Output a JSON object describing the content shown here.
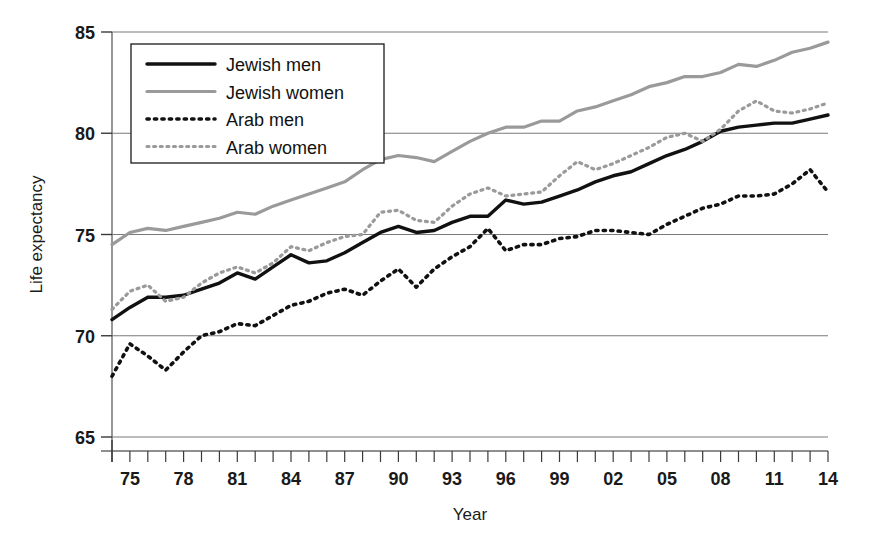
{
  "chart_data": {
    "type": "line",
    "title": "",
    "xlabel": "Year",
    "ylabel": "Life expectancy",
    "xlim": [
      1974,
      2014
    ],
    "ylim": [
      65,
      85
    ],
    "yticks": [
      65,
      70,
      75,
      80,
      85
    ],
    "ytick_labels": [
      "65",
      "70",
      "75",
      "80",
      "85"
    ],
    "xticks": [
      1975,
      1978,
      1981,
      1984,
      1987,
      1990,
      1993,
      1996,
      1999,
      2002,
      2005,
      2008,
      2011,
      2014
    ],
    "xtick_labels": [
      "75",
      "78",
      "81",
      "84",
      "87",
      "90",
      "93",
      "96",
      "99",
      "02",
      "05",
      "08",
      "11",
      "14"
    ],
    "minor_xticks_every": 1,
    "grid": "horizontal",
    "legend_position": "top-left-inside",
    "x": [
      1974,
      1975,
      1976,
      1977,
      1978,
      1979,
      1980,
      1981,
      1982,
      1983,
      1984,
      1985,
      1986,
      1987,
      1988,
      1989,
      1990,
      1991,
      1992,
      1993,
      1994,
      1995,
      1996,
      1997,
      1998,
      1999,
      2000,
      2001,
      2002,
      2003,
      2004,
      2005,
      2006,
      2007,
      2008,
      2009,
      2010,
      2011,
      2012,
      2013,
      2014
    ],
    "series": [
      {
        "name": "Jewish men",
        "style": "solid",
        "color": "#111111",
        "width": 3.4,
        "values": [
          70.8,
          71.4,
          71.9,
          71.9,
          72.0,
          72.3,
          72.6,
          73.1,
          72.8,
          73.4,
          74.0,
          73.6,
          73.7,
          74.1,
          74.6,
          75.1,
          75.4,
          75.1,
          75.2,
          75.6,
          75.9,
          75.9,
          76.7,
          76.5,
          76.6,
          76.9,
          77.2,
          77.6,
          77.9,
          78.1,
          78.5,
          78.9,
          79.2,
          79.6,
          80.1,
          80.3,
          80.4,
          80.5,
          80.5,
          80.7,
          80.9
        ]
      },
      {
        "name": "Jewish women",
        "style": "solid",
        "color": "#9a9a9a",
        "width": 3.2,
        "values": [
          74.5,
          75.1,
          75.3,
          75.2,
          75.4,
          75.6,
          75.8,
          76.1,
          76.0,
          76.4,
          76.7,
          77.0,
          77.3,
          77.6,
          78.2,
          78.7,
          78.9,
          78.8,
          78.6,
          79.1,
          79.6,
          80.0,
          80.3,
          80.3,
          80.6,
          80.6,
          81.1,
          81.3,
          81.6,
          81.9,
          82.3,
          82.5,
          82.8,
          82.8,
          83.0,
          83.4,
          83.3,
          83.6,
          84.0,
          84.2,
          84.5
        ]
      },
      {
        "name": "Arab men",
        "style": "dotted",
        "color": "#111111",
        "width": 3.6,
        "values": [
          68.0,
          69.6,
          69.0,
          68.3,
          69.2,
          70.0,
          70.2,
          70.6,
          70.5,
          71.0,
          71.5,
          71.7,
          72.1,
          72.3,
          72.0,
          72.7,
          73.3,
          72.4,
          73.3,
          73.9,
          74.4,
          75.3,
          74.2,
          74.5,
          74.5,
          74.8,
          74.9,
          75.2,
          75.2,
          75.1,
          75.0,
          75.5,
          75.9,
          76.3,
          76.5,
          76.9,
          76.9,
          77.0,
          77.5,
          78.2,
          77.1
        ]
      },
      {
        "name": "Arab women",
        "style": "dotted",
        "color": "#9a9a9a",
        "width": 3.2,
        "values": [
          71.3,
          72.2,
          72.5,
          71.7,
          71.9,
          72.6,
          73.1,
          73.4,
          73.1,
          73.6,
          74.4,
          74.2,
          74.6,
          74.9,
          75.0,
          76.1,
          76.2,
          75.7,
          75.6,
          76.4,
          77.0,
          77.3,
          76.9,
          77.0,
          77.1,
          77.9,
          78.6,
          78.2,
          78.5,
          78.9,
          79.3,
          79.8,
          80.0,
          79.6,
          80.2,
          81.1,
          81.6,
          81.1,
          81.0,
          81.2,
          81.5
        ]
      }
    ]
  },
  "legend": {
    "items": [
      {
        "label": "Jewish men"
      },
      {
        "label": "Jewish women"
      },
      {
        "label": "Arab men"
      },
      {
        "label": "Arab women"
      }
    ]
  },
  "axes": {
    "y_title": "Life expectancy",
    "x_title": "Year"
  }
}
